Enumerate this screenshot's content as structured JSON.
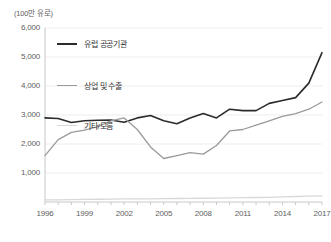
{
  "chart_data": {
    "type": "line",
    "title": "",
    "subtitle": "",
    "unit_label": "(100만 유로)",
    "xlabel": "",
    "ylabel": "",
    "ylim": [
      0,
      6000
    ],
    "xlim": [
      1996,
      2017
    ],
    "grid": true,
    "legend_position": "top-left-inside",
    "y_ticks": [
      "6,000",
      "5,000",
      "4,000",
      "3,000",
      "2,000",
      "1,000"
    ],
    "y_tick_values": [
      6000,
      5000,
      4000,
      3000,
      2000,
      1000
    ],
    "x_ticks": [
      "1996",
      "1999",
      "2002",
      "2005",
      "2008",
      "2011",
      "2014",
      "2017"
    ],
    "x_tick_values": [
      1996,
      1999,
      2002,
      2005,
      2008,
      2011,
      2014,
      2017
    ],
    "x": [
      1996,
      1997,
      1998,
      1999,
      2000,
      2001,
      2002,
      2003,
      2004,
      2005,
      2006,
      2007,
      2008,
      2009,
      2010,
      2011,
      2012,
      2013,
      2014,
      2015,
      2016,
      2017
    ],
    "series": [
      {
        "name": "유럽 공공기관",
        "color": "#2b2b2b",
        "width": 1.6,
        "values": [
          2900,
          2880,
          2740,
          2800,
          2820,
          2830,
          2750,
          2900,
          2980,
          2800,
          2700,
          2900,
          3050,
          2900,
          3200,
          3150,
          3150,
          3400,
          3500,
          3600,
          4100,
          5150
        ]
      },
      {
        "name": "상업 및 수출",
        "color": "#9a9a9a",
        "width": 1.3,
        "values": [
          1600,
          2150,
          2400,
          2480,
          2600,
          2800,
          2900,
          2500,
          1900,
          1500,
          1600,
          1700,
          1650,
          1950,
          2450,
          2500,
          2650,
          2800,
          2950,
          3050,
          3200,
          3450
        ]
      },
      {
        "name": "기타/모름",
        "color": "#d8d8d8",
        "width": 1.3,
        "values": [
          70,
          75,
          80,
          90,
          95,
          100,
          110,
          105,
          110,
          115,
          120,
          125,
          130,
          135,
          140,
          150,
          155,
          160,
          180,
          190,
          200,
          210
        ]
      }
    ]
  },
  "legend": {
    "items": [
      {
        "label": "유럽 공공기관",
        "color": "#2b2b2b",
        "width": 2
      },
      {
        "label": "상업 및 수출",
        "color": "#9a9a9a",
        "width": 1.6
      },
      {
        "label": "기타/모름",
        "color": "#d8d8d8",
        "width": 1.6
      }
    ]
  },
  "colors": {
    "axis": "#c8c8c8",
    "grid": "#ededed",
    "text": "#5e5e5e",
    "background": "#ffffff"
  }
}
